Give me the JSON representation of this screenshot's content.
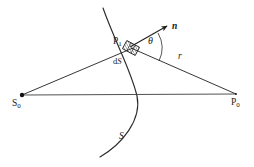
{
  "figure": {
    "domain_kind": "diagram",
    "background_color": "#ffffff",
    "stroke_color": "#262626",
    "label_color": "#1a1a1a",
    "width": 254,
    "height": 167
  },
  "labels": {
    "source_point": "S",
    "source_point_sub": "0",
    "observation_point": "P",
    "observation_point_sub": "0",
    "surface_point": "P",
    "surface_point_sub": "1",
    "area_element": "d",
    "area_element_italic": "S",
    "normal_vector": "n",
    "distance": "r",
    "surface": "S",
    "angle": "θ"
  },
  "geometry": {
    "source_S0": {
      "x": 22,
      "y": 95
    },
    "observation_P0": {
      "x": 236,
      "y": 94
    },
    "surface_point_P1": {
      "x": 131,
      "y": 48
    },
    "normal_arrow_tip": {
      "x": 168,
      "y": 25
    },
    "baseline": {
      "x1": 22,
      "y1": 95,
      "x2": 236,
      "y2": 94
    },
    "ray_incident": {
      "x1": 22,
      "y1": 95,
      "x2": 131,
      "y2": 48
    },
    "ray_diffracted": {
      "x1": 131,
      "y1": 48,
      "x2": 236,
      "y2": 94
    },
    "wavefront_arc": {
      "start_x": 103,
      "start_y": 8,
      "end_x": 100,
      "end_y": 157
    },
    "angle_arc_radius": 28
  },
  "annotations": {
    "area_element_shape": "hatched-parallelogram",
    "source_marker": "filled-dot",
    "normal_marker": "arrowhead"
  }
}
